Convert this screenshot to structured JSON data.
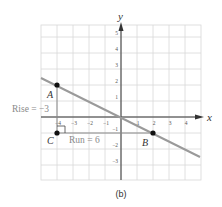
{
  "chart_data": {
    "type": "line",
    "title": "",
    "caption": "(b)",
    "xlabel": "x",
    "ylabel": "y",
    "xlim": [
      -5,
      5
    ],
    "ylim": [
      -4,
      6
    ],
    "grid": true,
    "x_ticks": [
      -4,
      -3,
      -2,
      -1,
      1,
      2,
      3,
      4
    ],
    "y_ticks": [
      5,
      4,
      3,
      2,
      1,
      -1,
      -2,
      -3
    ],
    "x_tick_labels": [
      "-4",
      "-3",
      "-2",
      "-1",
      "1",
      "2",
      "3",
      "4"
    ],
    "y_tick_labels": [
      "5",
      "4",
      "3",
      "2",
      "1",
      "-1",
      "-2",
      "-3"
    ],
    "series": [
      {
        "name": "line",
        "x": [
          -5,
          5
        ],
        "y": [
          2.5,
          -2.5
        ],
        "slope": -0.5
      }
    ],
    "points": [
      {
        "label": "A",
        "x": -4,
        "y": 2
      },
      {
        "label": "B",
        "x": 2,
        "y": -1
      },
      {
        "label": "C",
        "x": -4,
        "y": -1
      }
    ],
    "annotations": [
      {
        "text": "Rise = −3",
        "target": "segment A–C"
      },
      {
        "text": "Run = 6",
        "target": "segment C–B"
      }
    ]
  },
  "labels": {
    "x_axis": "x",
    "y_axis": "y",
    "point_a": "A",
    "point_b": "B",
    "point_c": "C",
    "rise": "Rise = −3",
    "run": "Run = 6",
    "caption": "(b)"
  },
  "colors": {
    "grid": "#d8d8d8",
    "axis": "#333333",
    "line": "#9a9a9a",
    "point": "#111111",
    "annotation": "#8a8a8a",
    "text": "#333333"
  }
}
